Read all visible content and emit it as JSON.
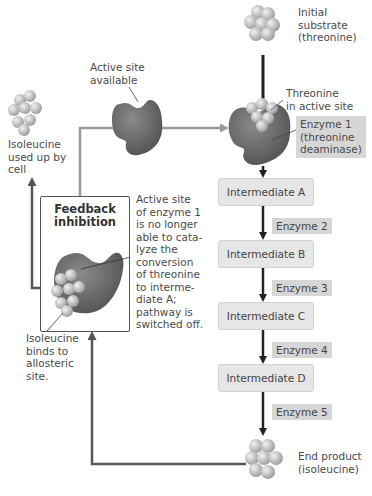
{
  "diagram": {
    "labels": {
      "initial_substrate": "Initial\nsubstrate\n(threonine)",
      "threonine_in_active_site": "Threonine\nin active site",
      "enzyme1": "Enzyme 1\n(threonine\ndeaminase)",
      "active_site_available": "Active site\navailable",
      "isoleucine_used_up": "Isoleucine\nused up by\ncell",
      "feedback_inhibition": "Feedback\ninhibition",
      "active_site_blocked": "Active site\nof enzyme 1\nis no longer\nable to cata-\nlyze the\nconversion\nof threonine\nto interme-\ndiate A;\npathway is\nswitched off.",
      "isoleucine_binds": "Isoleucine\nbinds to\nallosteric\nsite.",
      "end_product": "End product\n(isoleucine)"
    },
    "intermediates": [
      "Intermediate A",
      "Intermediate B",
      "Intermediate C",
      "Intermediate D"
    ],
    "enzymes": [
      "Enzyme 2",
      "Enzyme 3",
      "Enzyme 4",
      "Enzyme 5"
    ],
    "colors": {
      "enzyme": "#6f6f6f",
      "molecule": "#bdbdbd",
      "pathway_arrow": "#222222",
      "feedback_arrow": "#5a5a5a",
      "activation_arrow": "#9a9a9a",
      "box_fill": "#e6e6e6",
      "tag_fill": "#d6d6d6"
    }
  }
}
